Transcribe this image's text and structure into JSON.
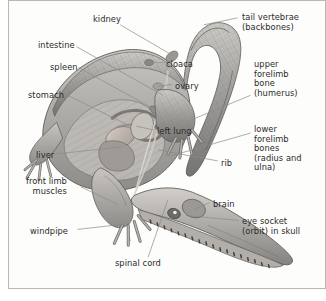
{
  "figure": {
    "background_color": "#fdfdfc",
    "border_color": "#b9b9b4",
    "text_color": "#2b2b2b",
    "leader_line_color": "#8a8a88",
    "art_tones": {
      "body_light": "#d8d6d2",
      "body_mid": "#a9a7a3",
      "body_dark": "#6f6d6a",
      "organ_warm": "#c9bdb8",
      "outline": "#5c5a57"
    }
  },
  "labels": [
    {
      "id": "kidney",
      "text": "kidney",
      "align": "left",
      "x": 84,
      "y": 14,
      "leader": [
        [
          112,
          24
        ],
        [
          165,
          55
        ]
      ]
    },
    {
      "id": "tail-vertebrae",
      "text": "tail vertebrae\n(backbones)",
      "align": "right",
      "x": 233,
      "y": 12,
      "leader": [
        [
          230,
          17
        ],
        [
          196,
          24
        ]
      ]
    },
    {
      "id": "intestine",
      "text": "intestine",
      "align": "left",
      "x": 29,
      "y": 40,
      "leader": [
        [
          68,
          46
        ],
        [
          155,
          95
        ]
      ]
    },
    {
      "id": "cloaca",
      "text": "cloaca",
      "align": "right",
      "x": 157,
      "y": 59,
      "leader": [
        [
          155,
          62
        ],
        [
          141,
          62
        ]
      ]
    },
    {
      "id": "spleen",
      "text": "spleen",
      "align": "left",
      "x": 41,
      "y": 62,
      "leader": [
        [
          70,
          67
        ],
        [
          148,
          110
        ]
      ]
    },
    {
      "id": "upper-forelimb",
      "text": "upper\nforelimb\nbone\n(humerus)",
      "align": "right",
      "x": 245,
      "y": 59,
      "leader": [
        [
          243,
          95
        ],
        [
          178,
          122
        ]
      ]
    },
    {
      "id": "ovary",
      "text": "ovary",
      "align": "right",
      "x": 166,
      "y": 81,
      "leader": [
        [
          164,
          84
        ],
        [
          150,
          86
        ]
      ]
    },
    {
      "id": "stomach",
      "text": "stomach",
      "align": "left",
      "x": 19,
      "y": 90,
      "leader": [
        [
          59,
          95
        ],
        [
          118,
          124
        ]
      ]
    },
    {
      "id": "left-lung",
      "text": "left lung",
      "align": "right",
      "x": 148,
      "y": 126,
      "leader": [
        [
          146,
          130
        ],
        [
          128,
          126
        ]
      ]
    },
    {
      "id": "lower-forelimb",
      "text": "lower\nforelimb\nbones\n(radius and\nulna)",
      "align": "right",
      "x": 245,
      "y": 124,
      "leader": [
        [
          243,
          133
        ],
        [
          163,
          156
        ]
      ]
    },
    {
      "id": "liver",
      "text": "liver",
      "align": "left",
      "x": 27,
      "y": 150,
      "leader": [
        [
          48,
          154
        ],
        [
          112,
          147
        ]
      ]
    },
    {
      "id": "rib",
      "text": "rib",
      "align": "right",
      "x": 212,
      "y": 158,
      "leader": [
        [
          210,
          161
        ],
        [
          150,
          150
        ]
      ]
    },
    {
      "id": "front-limb-muscles",
      "text": "front limb\nmuscles",
      "align": "left",
      "x": 17,
      "y": 176,
      "leader": [
        [
          72,
          187
        ],
        [
          110,
          205
        ]
      ]
    },
    {
      "id": "brain",
      "text": "brain",
      "align": "right",
      "x": 204,
      "y": 199,
      "leader": [
        [
          202,
          203
        ],
        [
          186,
          210
        ]
      ]
    },
    {
      "id": "eye-socket",
      "text": "eye socket\n(orbit) in skull",
      "align": "right",
      "x": 233,
      "y": 216,
      "leader": [
        [
          231,
          221
        ],
        [
          178,
          216
        ]
      ]
    },
    {
      "id": "windpipe",
      "text": "windpipe",
      "align": "left",
      "x": 21,
      "y": 226,
      "leader": [
        [
          69,
          230
        ],
        [
          122,
          224
        ]
      ]
    },
    {
      "id": "spinal-cord",
      "text": "spinal cord",
      "align": "left",
      "x": 106,
      "y": 258,
      "leader": [
        [
          140,
          258
        ],
        [
          160,
          200
        ]
      ]
    }
  ]
}
